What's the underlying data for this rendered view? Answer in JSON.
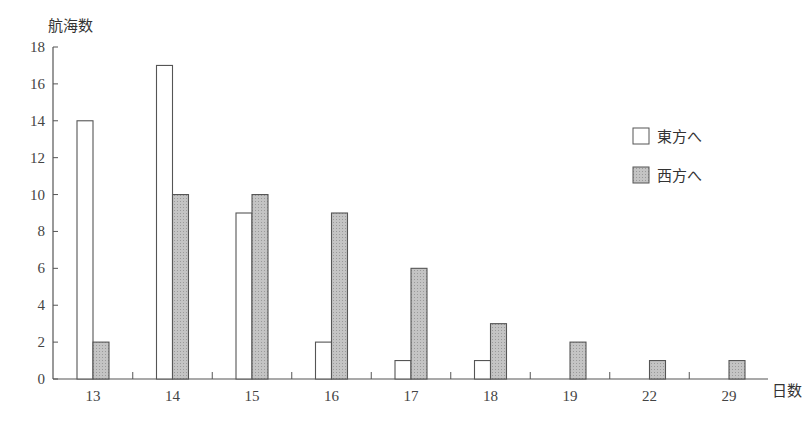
{
  "chart_data": {
    "type": "bar",
    "title": "",
    "xlabel": "日数",
    "ylabel": "航海数",
    "ylim": [
      0,
      18
    ],
    "yticks": [
      0,
      2,
      4,
      6,
      8,
      10,
      12,
      14,
      16,
      18
    ],
    "grid": false,
    "legend_position": "right",
    "categories": [
      "13",
      "14",
      "15",
      "16",
      "17",
      "18",
      "19",
      "22",
      "29"
    ],
    "series": [
      {
        "name": "東方へ",
        "fill": "#ffffff",
        "values": [
          14,
          17,
          9,
          2,
          1,
          1,
          0,
          0,
          0
        ]
      },
      {
        "name": "西方へ",
        "fill": "#b8b8b8",
        "values": [
          2,
          10,
          10,
          9,
          6,
          3,
          2,
          1,
          1
        ]
      }
    ]
  },
  "legend": [
    {
      "label": "東方へ",
      "swatch": "#ffffff"
    },
    {
      "label": "西方へ",
      "swatch": "#b8b8b8"
    }
  ],
  "colors": {
    "axis": "#555555",
    "bar_stroke": "#555555",
    "shaded": "#b8b8b8"
  }
}
